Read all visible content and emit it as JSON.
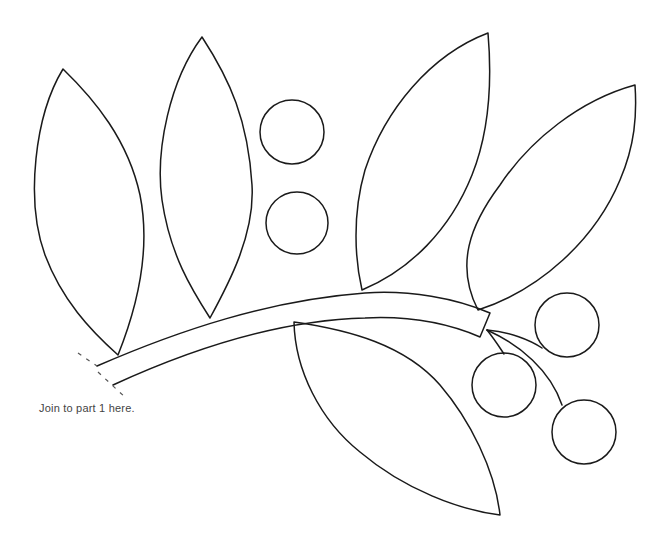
{
  "diagram": {
    "kind": "applique pattern template",
    "caption": "Join to part 1 here.",
    "stroke_color": "#1a1a1a",
    "background": "#ffffff",
    "parts": {
      "leaves": [
        {
          "id": "leaf-1",
          "position": "far left, upright"
        },
        {
          "id": "leaf-2",
          "position": "left, upright"
        },
        {
          "id": "leaf-3",
          "position": "center right, upright"
        },
        {
          "id": "leaf-4",
          "position": "far right, angled"
        },
        {
          "id": "leaf-5",
          "position": "bottom, hanging"
        }
      ],
      "berries": [
        {
          "id": "berry-1",
          "position": "top center"
        },
        {
          "id": "berry-2",
          "position": "middle center"
        },
        {
          "id": "berry-3",
          "position": "right upper"
        },
        {
          "id": "berry-4",
          "position": "right middle"
        },
        {
          "id": "berry-5",
          "position": "right lower"
        }
      ],
      "stem": {
        "id": "branch-stem",
        "join_marker": "dashed join lines at left end"
      }
    }
  }
}
